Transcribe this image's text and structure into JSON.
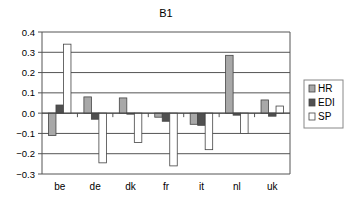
{
  "chart_data": {
    "type": "bar",
    "title": "B1",
    "xlabel": "",
    "ylabel": "",
    "categories": [
      "be",
      "de",
      "dk",
      "fr",
      "it",
      "nl",
      "uk"
    ],
    "series": [
      {
        "name": "HR",
        "color": "#a8a8a8",
        "values": [
          -0.11,
          0.08,
          0.075,
          -0.02,
          -0.055,
          0.285,
          0.065
        ]
      },
      {
        "name": "EDI",
        "color": "#505050",
        "values": [
          0.04,
          -0.03,
          -0.005,
          -0.04,
          -0.06,
          -0.01,
          -0.015
        ]
      },
      {
        "name": "SP",
        "color": "#ffffff",
        "values": [
          0.34,
          -0.245,
          -0.145,
          -0.26,
          -0.18,
          -0.1,
          0.035
        ]
      }
    ],
    "ylim": [
      -0.3,
      0.4
    ],
    "yticks": [
      0.4,
      0.3,
      0.2,
      0.1,
      0.0,
      -0.1,
      -0.2,
      -0.3
    ],
    "ytick_labels": [
      "0.4",
      "0.3",
      "0.2",
      "0.1",
      "0.0",
      "−0.1",
      "−0.2",
      "−0.3"
    ],
    "grid": true,
    "legend_position": "right"
  }
}
